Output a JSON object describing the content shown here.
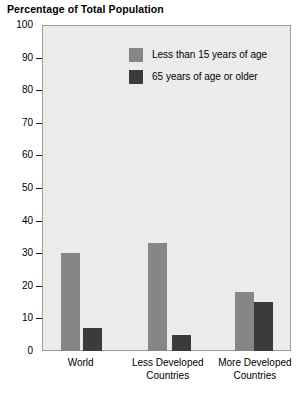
{
  "chart_data": {
    "type": "bar",
    "title": "Percentage of Total Population",
    "xlabel": "",
    "ylabel": "",
    "ylim": [
      0,
      100
    ],
    "yticks": [
      0,
      10,
      20,
      30,
      40,
      50,
      60,
      70,
      80,
      90,
      100
    ],
    "grid": false,
    "legend_position": "top-right-inside",
    "categories": [
      "World",
      "Less Developed Countries",
      "More Developed Countries"
    ],
    "series": [
      {
        "name": "Less than 15 years of age",
        "values": [
          30,
          33,
          18
        ],
        "color": "#868686"
      },
      {
        "name": "65 years of age or older",
        "values": [
          7,
          5,
          15
        ],
        "color": "#3b3b3b"
      }
    ]
  },
  "axis": {
    "y_tick_labels": [
      "100",
      "90",
      "80",
      "70",
      "60",
      "50",
      "40",
      "30",
      "20",
      "10",
      "0"
    ],
    "x_tick_labels": [
      {
        "line1": "World",
        "line2": ""
      },
      {
        "line1": "Less Developed",
        "line2": "Countries"
      },
      {
        "line1": "More Developed",
        "line2": "Countries"
      }
    ]
  },
  "legend": {
    "items": [
      {
        "label": "Less than 15 years of age",
        "swatch": "young"
      },
      {
        "label": "65 years of age or older",
        "swatch": "old"
      }
    ]
  },
  "colors": {
    "young": "#868686",
    "old": "#3b3b3b",
    "plot_background": "#e9e9e9",
    "plot_border": "#9a9a9a",
    "text": "#000000"
  }
}
